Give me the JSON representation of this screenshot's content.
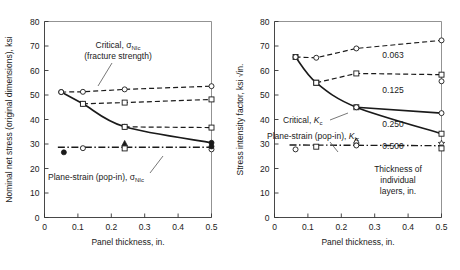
{
  "figure": {
    "title": "",
    "panels": [
      "left",
      "right"
    ]
  },
  "chart_data": [
    {
      "id": "left",
      "type": "line",
      "title": "",
      "xlabel": "Panel thickness, in.",
      "ylabel": "Nominal net stress (original dimensions), ksi",
      "xlim": [
        0,
        0.5
      ],
      "ylim": [
        0,
        80
      ],
      "xticks": [
        0,
        0.1,
        0.2,
        0.3,
        0.4,
        0.5
      ],
      "xticklabels": [
        "0",
        "0.1",
        "0.2",
        "0.3",
        "0.4",
        "0.5"
      ],
      "yticks": [
        0,
        10,
        20,
        30,
        40,
        50,
        60,
        70,
        80
      ],
      "yticklabels": [
        "0",
        "10",
        "20",
        "30",
        "40",
        "50",
        "60",
        "70",
        "80"
      ],
      "grid": false,
      "legend": "none",
      "annotations": [
        {
          "name": "critical-annotation",
          "text": "Critical, σNIc",
          "text2": "(fracture strength)"
        },
        {
          "name": "plane-strain-annotation",
          "text": "Plane-strain (pop-in), σNIc"
        }
      ],
      "series": [
        {
          "name": "Critical σNIc monolithic",
          "style": "solid",
          "marker": "filled-circle",
          "x": [
            0.05,
            0.115,
            0.24,
            0.5
          ],
          "y": [
            51.2,
            46.4,
            37.0,
            30.5
          ]
        },
        {
          "name": "Layer 0.063",
          "style": "dashed",
          "marker": "open-circle",
          "x": [
            0.05,
            0.115,
            0.24,
            0.5
          ],
          "y": [
            51.2,
            51.3,
            52.3,
            53.6
          ]
        },
        {
          "name": "Layer 0.125",
          "style": "dashed",
          "marker": "open-square",
          "x": [
            0.115,
            0.24,
            0.5
          ],
          "y": [
            46.4,
            46.9,
            48.2
          ]
        },
        {
          "name": "Layer 0.250",
          "style": "dashed",
          "marker": "open-square",
          "x": [
            0.24,
            0.5
          ],
          "y": [
            37.0,
            36.7
          ]
        },
        {
          "name": "Plane-strain pop-in σNIc",
          "style": "dashdot",
          "marker": "none",
          "x": [
            0.04,
            0.5
          ],
          "y": [
            28.7,
            28.7
          ]
        }
      ],
      "scatter_points": [
        {
          "marker": "filled-circle",
          "x": 0.058,
          "y": 26.6
        },
        {
          "marker": "open-circle",
          "x": 0.115,
          "y": 28.3
        },
        {
          "marker": "filled-triangle",
          "x": 0.24,
          "y": 30.2
        },
        {
          "marker": "open-square",
          "x": 0.24,
          "y": 28.2
        },
        {
          "marker": "open-circle",
          "x": 0.5,
          "y": 27.8
        },
        {
          "marker": "filled-circle",
          "x": 0.5,
          "y": 29.0
        }
      ]
    },
    {
      "id": "right",
      "type": "line",
      "title": "",
      "xlabel": "Panel thickness, in.",
      "ylabel": "Stress intensity factor, ksi √in.",
      "xlim": [
        0,
        0.5
      ],
      "ylim": [
        0,
        80
      ],
      "xticks": [
        0,
        0.1,
        0.2,
        0.3,
        0.4,
        0.5
      ],
      "xticklabels": [
        "0",
        "0.1",
        "0.2",
        "0.3",
        "0.4",
        "0.5"
      ],
      "yticks": [
        0,
        10,
        20,
        30,
        40,
        50,
        60,
        70,
        80
      ],
      "yticklabels": [
        "0",
        "10",
        "20",
        "30",
        "40",
        "50",
        "60",
        "70",
        "80"
      ],
      "grid": false,
      "legend": "none",
      "layer_labels": [
        {
          "name": "layer-label-0063",
          "text": "0.063"
        },
        {
          "name": "layer-label-0125",
          "text": "0.125"
        },
        {
          "name": "layer-label-0250",
          "text": "0.250"
        },
        {
          "name": "layer-label-0500",
          "text": "0.500"
        }
      ],
      "caption_lines": [
        "Thickness of",
        "individual",
        "layers, in."
      ],
      "annotations": [
        {
          "name": "critical-kc-annotation",
          "text": "Critical, Kc"
        },
        {
          "name": "plane-strain-kic-annotation",
          "text": "Plane-strain (pop-in), KIc"
        }
      ],
      "series": [
        {
          "name": "Critical Kc monolithic",
          "style": "solid",
          "marker": "open-square",
          "x": [
            0.063,
            0.125,
            0.245,
            0.5
          ],
          "y": [
            65.5,
            55.0,
            45.0,
            34.2
          ]
        },
        {
          "name": "Layer 0.063",
          "style": "dashed",
          "marker": "open-circle",
          "x": [
            0.063,
            0.125,
            0.245,
            0.5
          ],
          "y": [
            65.5,
            65.2,
            69.0,
            72.3
          ]
        },
        {
          "name": "Layer 0.125",
          "style": "dashed",
          "marker": "open-square",
          "x": [
            0.125,
            0.245,
            0.5
          ],
          "y": [
            55.0,
            58.8,
            58.3
          ]
        },
        {
          "name": "Layer 0.250",
          "style": "solid",
          "marker": "open-circle",
          "x": [
            0.245,
            0.5
          ],
          "y": [
            45.0,
            42.6
          ]
        },
        {
          "name": "Plane-strain pop-in KIc",
          "style": "dashdot",
          "marker": "none",
          "x": [
            0.045,
            0.5
          ],
          "y": [
            29.6,
            29.3
          ]
        }
      ],
      "scatter_points": [
        {
          "marker": "open-circle",
          "x": 0.063,
          "y": 27.8
        },
        {
          "marker": "open-square",
          "x": 0.125,
          "y": 28.9
        },
        {
          "marker": "open-triangle",
          "x": 0.245,
          "y": 31.2
        },
        {
          "marker": "open-circle",
          "x": 0.245,
          "y": 29.4
        },
        {
          "marker": "open-circle",
          "x": 0.5,
          "y": 55.6
        },
        {
          "marker": "open-star",
          "x": 0.5,
          "y": 30.2
        },
        {
          "marker": "open-square",
          "x": 0.5,
          "y": 28.2
        }
      ]
    }
  ],
  "colors": {
    "ink": "#1a1a1a",
    "axis": "#555555",
    "background": "#ffffff"
  }
}
